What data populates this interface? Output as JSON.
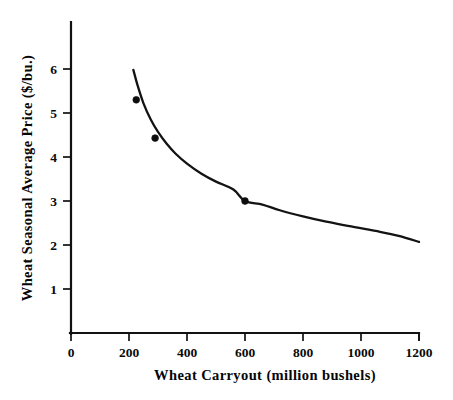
{
  "chart_data": {
    "type": "line",
    "title": "",
    "xlabel": "Wheat Carryout (million bushels)",
    "ylabel": "Wheat Seasonal Average Price ($/bu.)",
    "xlim": [
      0,
      1200
    ],
    "ylim": [
      0,
      6.6
    ],
    "grid": false,
    "legend": null,
    "xticks": [
      0,
      200,
      400,
      600,
      800,
      1000,
      1200
    ],
    "xticklabels": [
      "0",
      "200",
      "400",
      "600",
      "800",
      "1000",
      "1200"
    ],
    "yticks": [
      1,
      2,
      3,
      4,
      5,
      6
    ],
    "yticklabels": [
      "1",
      "2",
      "3",
      "4",
      "5",
      "6"
    ],
    "series": [
      {
        "name": "Wheat demand curve",
        "type": "line",
        "x": [
          215,
          230,
          250,
          275,
          300,
          330,
          360,
          400,
          450,
          500,
          560,
          600,
          660,
          720,
          800,
          880,
          960,
          1050,
          1130,
          1200
        ],
        "y": [
          5.98,
          5.62,
          5.22,
          4.85,
          4.57,
          4.3,
          4.08,
          3.85,
          3.62,
          3.44,
          3.26,
          3.0,
          2.92,
          2.79,
          2.65,
          2.53,
          2.43,
          2.32,
          2.21,
          2.07
        ]
      },
      {
        "name": "Observed points",
        "type": "scatter",
        "points": [
          {
            "x": 225,
            "y": 5.3
          },
          {
            "x": 290,
            "y": 4.43
          },
          {
            "x": 600,
            "y": 3.0
          }
        ]
      }
    ]
  },
  "axes": {
    "x_axis_name": "Wheat Carryout (million bushels)",
    "y_axis_name": "Wheat Seasonal Average Price ($/bu.)"
  },
  "colors": {
    "background": "#ffffff",
    "ink": "#111111",
    "curve": "#131313",
    "marker": "#0d0d0d"
  }
}
